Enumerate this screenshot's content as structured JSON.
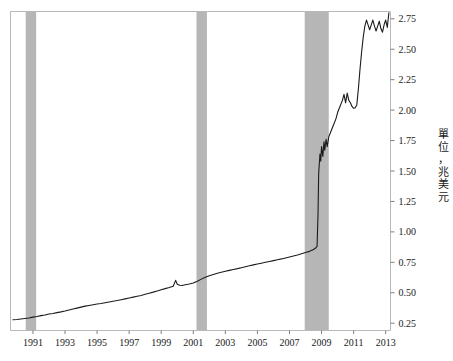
{
  "chart_data": {
    "type": "line",
    "title": "",
    "subtitle": "",
    "xlabel": "",
    "ylabel": "單位：兆美元",
    "ylabel_chars": [
      "單",
      "位",
      "，",
      "兆",
      "美",
      "元"
    ],
    "xlim": [
      1989.6,
      2013.3
    ],
    "ylim": [
      0.19,
      2.81
    ],
    "xticks": [
      1991,
      1993,
      1995,
      1997,
      1999,
      2001,
      2003,
      2005,
      2007,
      2009,
      2011,
      2013
    ],
    "xtick_labels": [
      "1991",
      "1993",
      "1995",
      "1997",
      "1999",
      "2001",
      "2003",
      "2005",
      "2007",
      "2009",
      "2011",
      "2013"
    ],
    "yticks": [
      0.25,
      0.5,
      0.75,
      1.0,
      1.25,
      1.5,
      1.75,
      2.0,
      2.25,
      2.5,
      2.75
    ],
    "ytick_labels": [
      "0.25",
      "0.50",
      "0.75",
      "1.00",
      "1.25",
      "1.50",
      "1.75",
      "2.00",
      "2.25",
      "2.50",
      "2.75"
    ],
    "grid": false,
    "legend": null,
    "yaxis_position": "right",
    "colors": {
      "line": "#1b1b1b",
      "recession_band": "#b6b6b6",
      "axis": "#b9b9b9",
      "text": "#1a1a1a",
      "background": "#ffffff"
    },
    "recession_bands": [
      {
        "label": "1990-91 recession",
        "start": 1990.55,
        "end": 1991.2
      },
      {
        "label": "2001 recession",
        "start": 2001.2,
        "end": 2001.85
      },
      {
        "label": "2007-09 recession",
        "start": 2007.95,
        "end": 2009.45
      }
    ],
    "series": [
      {
        "name": "總資產",
        "x": [
          1989.75,
          1990.0,
          1990.25,
          1990.5,
          1990.75,
          1991.0,
          1991.25,
          1991.5,
          1991.75,
          1992.0,
          1992.25,
          1992.5,
          1992.75,
          1993.0,
          1993.25,
          1993.5,
          1993.75,
          1994.0,
          1994.25,
          1994.5,
          1994.75,
          1995.0,
          1995.25,
          1995.5,
          1995.75,
          1996.0,
          1996.25,
          1996.5,
          1996.75,
          1997.0,
          1997.25,
          1997.5,
          1997.75,
          1998.0,
          1998.25,
          1998.5,
          1998.75,
          1999.0,
          1999.25,
          1999.5,
          1999.75,
          1999.9,
          2000.0,
          2000.15,
          2000.3,
          2000.5,
          2000.75,
          2001.0,
          2001.25,
          2001.5,
          2001.75,
          2002.0,
          2002.25,
          2002.5,
          2002.75,
          2003.0,
          2003.25,
          2003.5,
          2003.75,
          2004.0,
          2004.25,
          2004.5,
          2004.75,
          2005.0,
          2005.25,
          2005.5,
          2005.75,
          2006.0,
          2006.25,
          2006.5,
          2006.75,
          2007.0,
          2007.25,
          2007.5,
          2007.75,
          2008.0,
          2008.25,
          2008.5,
          2008.65,
          2008.72,
          2008.78,
          2008.82,
          2008.86,
          2008.9,
          2008.95,
          2009.0,
          2009.08,
          2009.15,
          2009.2,
          2009.28,
          2009.35,
          2009.45,
          2009.6,
          2009.75,
          2009.9,
          2010.0,
          2010.15,
          2010.3,
          2010.4,
          2010.5,
          2010.6,
          2010.7,
          2010.8,
          2010.9,
          2011.0,
          2011.1,
          2011.2,
          2011.3,
          2011.4,
          2011.5,
          2011.6,
          2011.7,
          2011.8,
          2011.9,
          2012.0,
          2012.1,
          2012.2,
          2012.3,
          2012.4,
          2012.5,
          2012.6,
          2012.7,
          2012.8,
          2012.9,
          2013.0,
          2013.1,
          2013.2
        ],
        "y": [
          0.278,
          0.28,
          0.285,
          0.289,
          0.293,
          0.3,
          0.305,
          0.312,
          0.318,
          0.325,
          0.33,
          0.337,
          0.343,
          0.35,
          0.358,
          0.366,
          0.374,
          0.382,
          0.39,
          0.396,
          0.402,
          0.408,
          0.412,
          0.418,
          0.424,
          0.43,
          0.436,
          0.443,
          0.45,
          0.457,
          0.464,
          0.471,
          0.478,
          0.487,
          0.496,
          0.505,
          0.515,
          0.525,
          0.534,
          0.543,
          0.554,
          0.602,
          0.57,
          0.562,
          0.56,
          0.566,
          0.572,
          0.58,
          0.595,
          0.612,
          0.628,
          0.64,
          0.65,
          0.66,
          0.668,
          0.676,
          0.684,
          0.691,
          0.698,
          0.706,
          0.714,
          0.722,
          0.729,
          0.736,
          0.743,
          0.75,
          0.757,
          0.764,
          0.771,
          0.778,
          0.786,
          0.794,
          0.802,
          0.81,
          0.82,
          0.83,
          0.84,
          0.855,
          0.87,
          0.88,
          1.15,
          1.48,
          1.56,
          1.64,
          1.58,
          1.7,
          1.62,
          1.74,
          1.67,
          1.76,
          1.7,
          1.78,
          1.83,
          1.88,
          1.93,
          1.98,
          2.03,
          2.08,
          2.13,
          2.06,
          2.14,
          2.08,
          2.06,
          2.03,
          2.015,
          2.02,
          2.045,
          2.18,
          2.34,
          2.48,
          2.6,
          2.69,
          2.74,
          2.7,
          2.66,
          2.7,
          2.74,
          2.69,
          2.65,
          2.69,
          2.73,
          2.67,
          2.64,
          2.7,
          2.74,
          2.68,
          2.8
        ]
      }
    ]
  }
}
